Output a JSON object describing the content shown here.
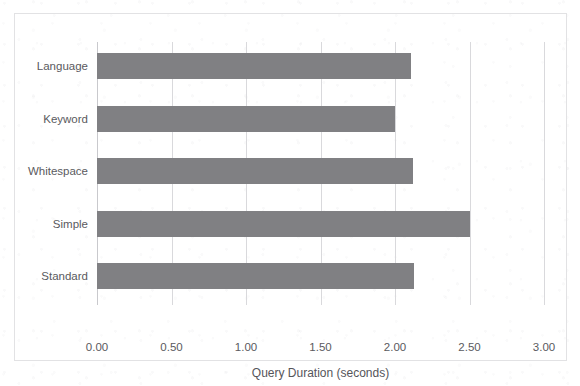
{
  "chart_data": {
    "type": "bar",
    "orientation": "horizontal",
    "title": "",
    "subtitle": "",
    "xlabel": "Query Duration (seconds)",
    "ylabel": "",
    "categories": [
      "Language",
      "Keyword",
      "Whitespace",
      "Simple",
      "Standard"
    ],
    "values": [
      2.11,
      2.0,
      2.12,
      2.5,
      2.13
    ],
    "series": [
      {
        "name": "Query Duration",
        "values": [
          2.11,
          2.0,
          2.12,
          2.5,
          2.13
        ]
      }
    ],
    "xlim": [
      0.0,
      3.0
    ],
    "xticks": [
      0.0,
      0.5,
      1.0,
      1.5,
      2.0,
      2.5,
      3.0
    ],
    "xtick_labels": [
      "0.00",
      "0.50",
      "1.00",
      "1.50",
      "2.00",
      "2.50",
      "3.00"
    ],
    "grid": "vertical-only",
    "legend": "none",
    "legend_position": "",
    "annotations": [],
    "bar_color": "#808083",
    "gridline_color": "#d9d9dc",
    "text_color": "#5a5a5e",
    "border_color": "#e2e2e4",
    "background_color": "#ffffff"
  }
}
